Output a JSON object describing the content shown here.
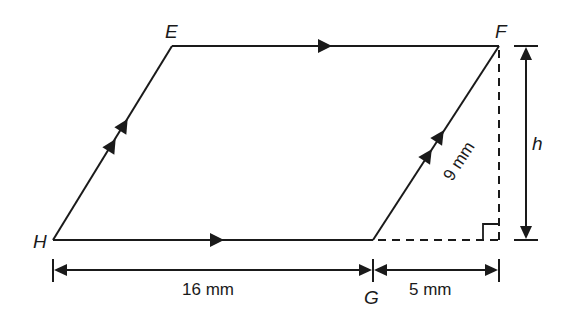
{
  "diagram": {
    "type": "parallelogram with perpendicular height",
    "colors": {
      "stroke": "#1a1a1a",
      "background": "#ffffff"
    },
    "vertices": {
      "E": {
        "label": "E",
        "x": 172,
        "y": 46
      },
      "F": {
        "label": "F",
        "x": 499,
        "y": 46
      },
      "G": {
        "label": "G",
        "x": 373,
        "y": 240
      },
      "H": {
        "label": "H",
        "x": 53,
        "y": 240
      }
    },
    "labels": {
      "E": "E",
      "F": "F",
      "G": "G",
      "H": "H",
      "height": "h",
      "side_GF": "9 mm",
      "base_HG": "16 mm",
      "extension_GX": "5 mm"
    },
    "markings": {
      "parallel_single_arrows": [
        "EF",
        "HG"
      ],
      "parallel_double_arrows": [
        "HE",
        "GF"
      ],
      "right_angle": "foot of perpendicular from F on extended HG",
      "dashed_lines": [
        "F to foot (height)",
        "G to foot (base extension)"
      ]
    },
    "measurements": {
      "HG": "16 mm",
      "GF": "9 mm",
      "extension": "5 mm",
      "height": "h"
    }
  }
}
